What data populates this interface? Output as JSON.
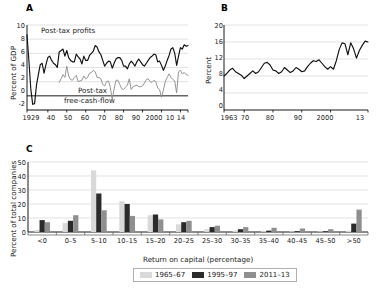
{
  "figure": {
    "background": "#ffffff",
    "panels": [
      "A",
      "B",
      "C"
    ]
  },
  "panelA": {
    "letter": "A",
    "ylabel": "Percent of GDP",
    "yticks": [
      "10",
      "8",
      "6",
      "4",
      "2",
      "0",
      "-2"
    ],
    "xticks": [
      "1929",
      "40",
      "50",
      "60",
      "70",
      "80",
      "90",
      "2000",
      "10",
      "14"
    ],
    "annotation_profits": "Post-tax profits",
    "annotation_cashflow_line1": "Post-tax",
    "annotation_cashflow_line2": "free-cash-flow",
    "color_profits": "#111111",
    "color_cashflow": "#8f8f8f"
  },
  "panelB": {
    "letter": "B",
    "ylabel": "Percent",
    "yticks": [
      "20",
      "16",
      "12",
      "8",
      "4",
      "0"
    ],
    "xticks": [
      "1963",
      "70",
      "80",
      "90",
      "2000",
      "13"
    ],
    "color_line": "#111111"
  },
  "panelC": {
    "letter": "C",
    "ylabel": "Percent of total companies",
    "xlabel": "Return on capital (percentage)",
    "yticks": [
      "50",
      "40",
      "30",
      "20",
      "10",
      "0"
    ],
    "legend": [
      {
        "label": "1965–67",
        "color": "#d9d9d9"
      },
      {
        "label": "1995–97",
        "color": "#2b2b2b"
      },
      {
        "label": "2011–13",
        "color": "#8f8f8f"
      }
    ]
  },
  "chart_data": [
    {
      "type": "line",
      "panel": "A",
      "title": "",
      "xlabel": "",
      "ylabel": "Percent of GDP",
      "ylim": [
        -2,
        10
      ],
      "xlim": [
        1929,
        2014
      ],
      "grid": true,
      "legend_position": "inline-annotations",
      "annotations": [
        "Post-tax profits",
        "Post-tax free-cash-flow"
      ],
      "series": [
        {
          "name": "Post-tax profits",
          "color": "#111111",
          "x": [
            1929,
            1930,
            1931,
            1932,
            1933,
            1934,
            1935,
            1936,
            1937,
            1938,
            1939,
            1940,
            1941,
            1942,
            1943,
            1944,
            1945,
            1946,
            1947,
            1948,
            1949,
            1950,
            1951,
            1952,
            1953,
            1954,
            1955,
            1956,
            1957,
            1958,
            1959,
            1960,
            1961,
            1962,
            1963,
            1964,
            1965,
            1966,
            1967,
            1968,
            1969,
            1970,
            1971,
            1972,
            1973,
            1974,
            1975,
            1976,
            1977,
            1978,
            1979,
            1980,
            1981,
            1982,
            1983,
            1984,
            1985,
            1986,
            1987,
            1988,
            1989,
            1990,
            1991,
            1992,
            1993,
            1994,
            1995,
            1996,
            1997,
            1998,
            1999,
            2000,
            2001,
            2002,
            2003,
            2004,
            2005,
            2006,
            2007,
            2008,
            2009,
            2010,
            2011,
            2012,
            2013,
            2014
          ],
          "values": [
            8.6,
            5.0,
            1.0,
            -1.2,
            -1.1,
            1.5,
            3.0,
            4.4,
            4.6,
            3.2,
            4.4,
            5.4,
            5.6,
            5.0,
            4.6,
            4.4,
            4.0,
            6.2,
            6.4,
            6.6,
            5.6,
            6.4,
            5.4,
            5.0,
            4.8,
            4.8,
            5.9,
            5.5,
            5.2,
            4.5,
            5.6,
            5.0,
            5.0,
            5.7,
            6.0,
            6.3,
            7.1,
            6.9,
            6.2,
            5.8,
            5.0,
            4.2,
            4.6,
            4.9,
            4.8,
            3.9,
            4.6,
            5.2,
            5.4,
            5.4,
            5.0,
            4.2,
            4.2,
            3.8,
            4.5,
            4.9,
            4.6,
            4.2,
            4.8,
            5.2,
            4.8,
            4.4,
            4.2,
            4.6,
            5.0,
            5.4,
            5.6,
            5.9,
            5.8,
            4.8,
            4.9,
            4.3,
            3.6,
            4.2,
            5.0,
            5.7,
            6.6,
            6.8,
            6.0,
            4.3,
            5.6,
            6.8,
            6.6,
            7.2,
            7.0,
            7.1
          ]
        },
        {
          "name": "Post-tax free-cash-flow",
          "color": "#8f8f8f",
          "x": [
            1946,
            1947,
            1948,
            1949,
            1950,
            1951,
            1952,
            1953,
            1954,
            1955,
            1956,
            1957,
            1958,
            1959,
            1960,
            1961,
            1962,
            1963,
            1964,
            1965,
            1966,
            1967,
            1968,
            1969,
            1970,
            1971,
            1972,
            1973,
            1974,
            1975,
            1976,
            1977,
            1978,
            1979,
            1980,
            1981,
            1982,
            1983,
            1984,
            1985,
            1986,
            1987,
            1988,
            1989,
            1990,
            1991,
            1992,
            1993,
            1994,
            1995,
            1996,
            1997,
            1998,
            1999,
            2000,
            2001,
            2002,
            2003,
            2004,
            2005,
            2006,
            2007,
            2008,
            2009,
            2010,
            2011,
            2012,
            2013,
            2014
          ],
          "values": [
            1.9,
            2.4,
            3.0,
            2.6,
            4.2,
            2.8,
            2.3,
            2.2,
            2.6,
            2.9,
            2.0,
            2.1,
            2.2,
            2.8,
            2.4,
            2.6,
            3.2,
            3.3,
            3.6,
            3.4,
            2.6,
            2.6,
            2.4,
            1.6,
            1.4,
            2.0,
            2.1,
            1.2,
            -0.6,
            1.0,
            2.2,
            2.2,
            1.6,
            1.0,
            0.9,
            1.2,
            1.5,
            2.4,
            0.9,
            1.3,
            1.4,
            1.5,
            1.3,
            1.3,
            1.4,
            1.8,
            2.3,
            2.4,
            2.0,
            1.9,
            2.2,
            2.0,
            1.1,
            0.9,
            -0.2,
            0.8,
            2.0,
            2.6,
            3.1,
            2.6,
            2.3,
            2.1,
            0.4,
            3.4,
            3.6,
            3.1,
            3.3,
            3.0,
            2.9
          ]
        }
      ]
    },
    {
      "type": "line",
      "panel": "B",
      "title": "",
      "xlabel": "",
      "ylabel": "Percent",
      "ylim": [
        0,
        20
      ],
      "xlim": [
        1963,
        2013
      ],
      "grid": true,
      "series": [
        {
          "name": "Percent",
          "color": "#111111",
          "x": [
            1963,
            1964,
            1965,
            1966,
            1967,
            1968,
            1969,
            1970,
            1971,
            1972,
            1973,
            1974,
            1975,
            1976,
            1977,
            1978,
            1979,
            1980,
            1981,
            1982,
            1983,
            1984,
            1985,
            1986,
            1987,
            1988,
            1989,
            1990,
            1991,
            1992,
            1993,
            1994,
            1995,
            1996,
            1997,
            1998,
            1999,
            2000,
            2001,
            2002,
            2003,
            2004,
            2005,
            2006,
            2007,
            2008,
            2009,
            2010,
            2011,
            2012,
            2013
          ],
          "values": [
            8.0,
            8.6,
            9.4,
            9.8,
            9.0,
            8.6,
            8.2,
            7.4,
            8.0,
            8.6,
            9.2,
            8.6,
            9.0,
            10.0,
            11.0,
            11.2,
            10.6,
            9.4,
            9.2,
            8.6,
            9.0,
            10.0,
            9.4,
            8.8,
            9.2,
            10.0,
            9.6,
            9.0,
            9.2,
            10.2,
            11.0,
            11.6,
            11.4,
            11.8,
            11.0,
            10.2,
            9.6,
            10.2,
            9.6,
            11.6,
            14.2,
            15.8,
            15.6,
            13.0,
            15.8,
            14.4,
            12.2,
            14.0,
            15.2,
            16.2,
            16.0
          ]
        }
      ]
    },
    {
      "type": "bar",
      "panel": "C",
      "title": "",
      "xlabel": "Return on capital (percentage)",
      "ylabel": "Percent of total companies",
      "ylim": [
        0,
        50
      ],
      "grid": true,
      "legend_position": "bottom",
      "categories": [
        "<0",
        "0–5",
        "5–10",
        "10–15",
        "15–20",
        "20–25",
        "25–30",
        "30–35",
        "35–40",
        "40–45",
        "45–50",
        ">50"
      ],
      "series": [
        {
          "name": "1965–67",
          "color": "#d9d9d9",
          "values": [
            1.5,
            6.5,
            44.0,
            22.0,
            12.0,
            5.5,
            2.0,
            1.0,
            0.6,
            0.4,
            0.3,
            1.0
          ]
        },
        {
          "name": "1995–97",
          "color": "#2b2b2b",
          "values": [
            8.5,
            8.0,
            27.5,
            20.0,
            12.5,
            7.0,
            3.5,
            2.0,
            1.0,
            0.6,
            0.5,
            6.0
          ]
        },
        {
          "name": "2011–13",
          "color": "#8f8f8f",
          "values": [
            7.0,
            12.0,
            15.5,
            11.5,
            9.0,
            8.0,
            4.5,
            3.5,
            3.0,
            2.5,
            2.0,
            16.0
          ]
        }
      ]
    }
  ]
}
